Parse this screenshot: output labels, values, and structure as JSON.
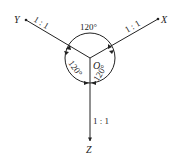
{
  "diagram": {
    "type": "axonometric-axes",
    "origin_label": "O",
    "axes": [
      {
        "name": "X",
        "ratio": "1 : 1",
        "direction": "upper-right"
      },
      {
        "name": "Y",
        "ratio": "1 : 1",
        "direction": "upper-left"
      },
      {
        "name": "Z",
        "ratio": "1 : 1",
        "direction": "down"
      }
    ],
    "angles": [
      {
        "label": "120°",
        "between": "X-Y",
        "position": "top"
      },
      {
        "label": "120°",
        "between": "Y-Z",
        "position": "lower-left"
      },
      {
        "label": "120°",
        "between": "X-Z",
        "position": "lower-right"
      }
    ],
    "colors": {
      "line": "#222222",
      "background": "#ffffff"
    }
  }
}
